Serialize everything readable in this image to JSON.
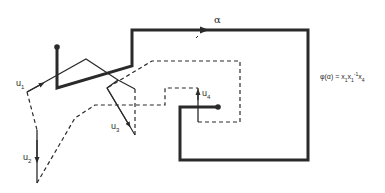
{
  "diagram": {
    "path_label": "α",
    "labels": {
      "u1": {
        "base": "u",
        "sub": "1"
      },
      "u2": {
        "base": "u",
        "sub": "2"
      },
      "u3": {
        "base": "u",
        "sub": "3"
      },
      "u4": {
        "base": "u",
        "sub": "4"
      }
    },
    "formula": {
      "lhs": "φ(α) = ",
      "terms": [
        {
          "base": "x",
          "sub": "1",
          "sup": ""
        },
        {
          "base": "x",
          "sub": "1",
          "sup": "-1"
        },
        {
          "base": "x",
          "sub": "4",
          "sup": ""
        }
      ]
    },
    "colors": {
      "stroke": "#2a2a2a",
      "background": "#ffffff"
    }
  }
}
